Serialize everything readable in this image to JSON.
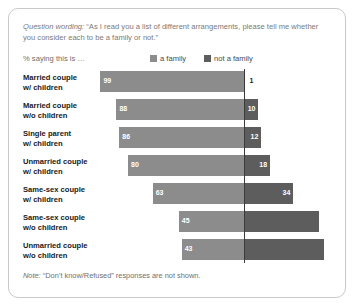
{
  "card": {
    "question_label": "Question wording:",
    "question_text": "“As I read you a list of different arrangements, please tell me whether you consider each to be a family or not.”",
    "saying_label": "% saying this is …",
    "note_label": "Note:",
    "note_text": " “Don’t know/Refused” responses are not shown."
  },
  "legend": {
    "family": {
      "label": "a family",
      "color": "#8c8c8c",
      "swatch_name": "legend-swatch-family"
    },
    "not_family": {
      "label": "not a family",
      "color": "#5d5d5d",
      "swatch_name": "legend-swatch-not-family"
    }
  },
  "chart_data": {
    "type": "bar",
    "title": "“As I read you a list of different arrangements, please tell me whether you consider each to be a family or not.”",
    "subtitle": "% saying this is …",
    "xlabel": "",
    "ylabel": "",
    "orientation": "horizontal",
    "stacked": true,
    "diverging": true,
    "grid": false,
    "legend_position": "top-right",
    "axis_line_at_boundary": true,
    "categories": [
      "Married couple w/ children",
      "Married couple w/o children",
      "Single parent w/ children",
      "Unmarried couple w/ children",
      "Same-sex couple w/ children",
      "Same-sex couple w/o children",
      "Unmarried couple w/o children"
    ],
    "category_lines": [
      [
        "Married couple",
        "w/ children"
      ],
      [
        "Married couple",
        "w/o children"
      ],
      [
        "Single parent",
        "w/ children"
      ],
      [
        "Unmarried couple",
        "w/ children"
      ],
      [
        "Same-sex couple",
        "w/ children"
      ],
      [
        "Same-sex couple",
        "w/o children"
      ],
      [
        "Unmarried couple",
        "w/o children"
      ]
    ],
    "series": [
      {
        "name": "a family",
        "color": "#8c8c8c",
        "values": [
          99,
          88,
          86,
          80,
          63,
          45,
          43
        ]
      },
      {
        "name": "not a family",
        "color": "#5d5d5d",
        "values": [
          1,
          10,
          12,
          18,
          34,
          52,
          55
        ]
      }
    ],
    "labels_shown": {
      "a family": [
        "99",
        "88",
        "86",
        "80",
        "63",
        "45",
        "43"
      ],
      "not a family": [
        "1",
        "10",
        "12",
        "18",
        "34",
        "",
        ""
      ]
    },
    "xlim": [
      0,
      100
    ]
  },
  "rows": [
    {
      "l1": "Married couple",
      "l2": "w/ children",
      "a": 99,
      "b": 1,
      "a_label": "99",
      "b_label": "1",
      "b_outside": true
    },
    {
      "l1": "Married couple",
      "l2": "w/o children",
      "a": 88,
      "b": 10,
      "a_label": "88",
      "b_label": "10",
      "b_outside": false
    },
    {
      "l1": "Single parent",
      "l2": "w/ children",
      "a": 86,
      "b": 12,
      "a_label": "86",
      "b_label": "12",
      "b_outside": false
    },
    {
      "l1": "Unmarried couple",
      "l2": "w/ children",
      "a": 80,
      "b": 18,
      "a_label": "80",
      "b_label": "18",
      "b_outside": false
    },
    {
      "l1": "Same-sex couple",
      "l2": "w/ children",
      "a": 63,
      "b": 34,
      "a_label": "63",
      "b_label": "34",
      "b_outside": false
    },
    {
      "l1": "Same-sex couple",
      "l2": "w/o children",
      "a": 45,
      "b": 52,
      "a_label": "45",
      "b_label": "",
      "b_outside": false
    },
    {
      "l1": "Unmarried couple",
      "l2": "w/o children",
      "a": 43,
      "b": 55,
      "a_label": "43",
      "b_label": "",
      "b_outside": false
    }
  ]
}
